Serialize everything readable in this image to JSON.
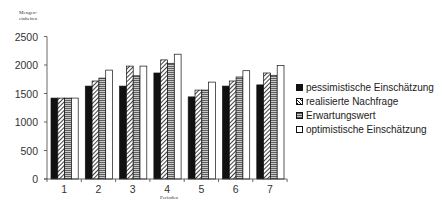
{
  "chart_data": {
    "type": "bar",
    "title": "",
    "ylabel": "Mengen-\neinheiten",
    "ylabel_lines": [
      "Mengen-",
      "einheiten"
    ],
    "xlabel": "Perioden",
    "categories": [
      "1",
      "2",
      "3",
      "4",
      "5",
      "6",
      "7"
    ],
    "series": [
      {
        "name": "pessimistische Einschätzung",
        "pattern": "solid-black",
        "values": [
          1420,
          1630,
          1630,
          1860,
          1440,
          1630,
          1650
        ]
      },
      {
        "name": "realisierte Nachfrage",
        "pattern": "diagonal-hatch",
        "values": [
          1420,
          1720,
          1980,
          2090,
          1560,
          1720,
          1860
        ]
      },
      {
        "name": "Erwartungswert",
        "pattern": "horizontal-lines-grey",
        "values": [
          1420,
          1770,
          1810,
          2030,
          1560,
          1790,
          1820
        ]
      },
      {
        "name": "optimistische Einschätzung",
        "pattern": "white",
        "values": [
          1420,
          1910,
          1980,
          2190,
          1700,
          1900,
          1990
        ]
      }
    ],
    "yticks": [
      0,
      500,
      1000,
      1500,
      2000,
      2500
    ],
    "ylim": [
      0,
      2500
    ],
    "grid": false,
    "legend_position": "right"
  }
}
